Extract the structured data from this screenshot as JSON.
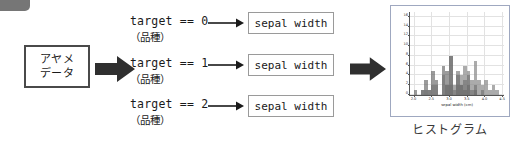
{
  "diagram": {
    "source": {
      "line1": "アヤメ",
      "line2": "データ"
    },
    "branches": [
      {
        "code": "target == 0",
        "note": "（品種）",
        "column": "sepal width"
      },
      {
        "code": "target == 1",
        "note": "（品種）",
        "column": "sepal width"
      },
      {
        "code": "target == 2",
        "note": "（品種）",
        "column": "sepal width"
      }
    ],
    "result_caption": "ヒストグラム"
  },
  "chart_data": {
    "type": "bar",
    "title": "",
    "xlabel": "sepal width (cm)",
    "ylabel": "",
    "xlim": [
      1.9,
      4.55
    ],
    "ylim": [
      0,
      17
    ],
    "grid": true,
    "legend": "none",
    "xticks": [
      "2.0",
      "2.5",
      "3.0",
      "3.5",
      "4.0",
      "4.5"
    ],
    "xtick_values": [
      2.0,
      2.5,
      3.0,
      3.5,
      4.0,
      4.5
    ],
    "yticks": [
      "0",
      "2",
      "4",
      "6",
      "8",
      "10",
      "12",
      "14",
      "16"
    ],
    "ytick_values": [
      0,
      2,
      4,
      6,
      8,
      10,
      12,
      14,
      16
    ],
    "bin_edges": [
      2.0,
      2.1,
      2.2,
      2.3,
      2.4,
      2.5,
      2.6,
      2.7,
      2.8,
      2.9,
      3.0,
      3.1,
      3.2,
      3.3,
      3.4,
      3.5,
      3.6,
      3.7,
      3.8,
      3.9,
      4.0,
      4.1,
      4.2,
      4.3,
      4.4
    ],
    "series": [
      {
        "name": "target == 0",
        "color": "#8f8f8f",
        "values": [
          0,
          0,
          0,
          1,
          0,
          0,
          0,
          0,
          0,
          2,
          2,
          1,
          2,
          4,
          6,
          5,
          3,
          7,
          3,
          2,
          3,
          1,
          2,
          1
        ]
      },
      {
        "name": "target == 1",
        "color": "#5d5d5d",
        "values": [
          1,
          0,
          1,
          3,
          1,
          5,
          3,
          0,
          6,
          5,
          8,
          0,
          4,
          2,
          1,
          2,
          0,
          1,
          0,
          0,
          0,
          0,
          0,
          0
        ]
      },
      {
        "name": "target == 2",
        "color": "#707070",
        "values": [
          0,
          0,
          1,
          0,
          1,
          2,
          2,
          0,
          4,
          2,
          8,
          2,
          5,
          2,
          3,
          4,
          1,
          2,
          0,
          1,
          0,
          0,
          0,
          0
        ]
      }
    ],
    "stack_peaks": [
      {
        "x": 2.0,
        "h": 1
      },
      {
        "x": 2.1,
        "h": 0
      },
      {
        "x": 2.2,
        "h": 2
      },
      {
        "x": 2.3,
        "h": 4
      },
      {
        "x": 2.4,
        "h": 2
      },
      {
        "x": 2.5,
        "h": 6
      },
      {
        "x": 2.6,
        "h": 4
      },
      {
        "x": 2.7,
        "h": 1
      },
      {
        "x": 2.8,
        "h": 12
      },
      {
        "x": 2.9,
        "h": 7
      },
      {
        "x": 3.0,
        "h": 16
      },
      {
        "x": 3.1,
        "h": 3
      },
      {
        "x": 3.2,
        "h": 11
      },
      {
        "x": 3.3,
        "h": 7
      },
      {
        "x": 3.4,
        "h": 10
      },
      {
        "x": 3.5,
        "h": 15
      },
      {
        "x": 3.6,
        "h": 5
      },
      {
        "x": 3.7,
        "h": 6
      },
      {
        "x": 3.8,
        "h": 5
      },
      {
        "x": 3.9,
        "h": 3
      },
      {
        "x": 4.0,
        "h": 3
      },
      {
        "x": 4.1,
        "h": 2
      },
      {
        "x": 4.2,
        "h": 2
      },
      {
        "x": 4.3,
        "h": 2
      }
    ]
  }
}
